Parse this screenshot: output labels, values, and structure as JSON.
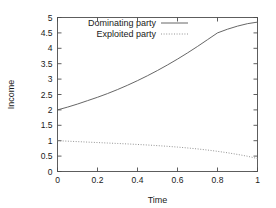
{
  "chart_data": {
    "type": "line",
    "title": "",
    "xlabel": "Time",
    "ylabel": "Income",
    "xlim": [
      0,
      1
    ],
    "ylim": [
      0,
      5
    ],
    "grid": false,
    "legend_position": "top-left-inside",
    "xticks": [
      "0",
      "0.2",
      "0.4",
      "0.6",
      "0.8",
      "1"
    ],
    "xtick_values": [
      0,
      0.2,
      0.4,
      0.6,
      0.8,
      1
    ],
    "yticks": [
      "0",
      "0.5",
      "1",
      "1.5",
      "2",
      "2.5",
      "3",
      "3.5",
      "4",
      "4.5",
      "5"
    ],
    "ytick_values": [
      0,
      0.5,
      1,
      1.5,
      2,
      2.5,
      3,
      3.5,
      4,
      4.5,
      5
    ],
    "x": [
      0,
      0.05,
      0.1,
      0.15,
      0.2,
      0.25,
      0.3,
      0.35,
      0.4,
      0.45,
      0.5,
      0.55,
      0.6,
      0.65,
      0.7,
      0.75,
      0.8,
      0.85,
      0.9,
      0.95,
      1
    ],
    "series": [
      {
        "name": "Dominating party",
        "style": "solid",
        "color": "#555555",
        "values": [
          2.0,
          2.09,
          2.19,
          2.3,
          2.41,
          2.53,
          2.66,
          2.8,
          2.95,
          3.11,
          3.28,
          3.46,
          3.65,
          3.85,
          4.06,
          4.28,
          4.5,
          4.62,
          4.72,
          4.8,
          4.85
        ]
      },
      {
        "name": "Exploited party",
        "style": "dotted",
        "color": "#888888",
        "values": [
          1.0,
          0.985,
          0.97,
          0.955,
          0.94,
          0.925,
          0.91,
          0.895,
          0.878,
          0.86,
          0.84,
          0.818,
          0.793,
          0.765,
          0.733,
          0.697,
          0.655,
          0.608,
          0.555,
          0.495,
          0.42
        ]
      }
    ]
  },
  "legend": {
    "entries": [
      {
        "label": "Dominating party",
        "style": "solid"
      },
      {
        "label": "Exploited party",
        "style": "dotted"
      }
    ]
  }
}
